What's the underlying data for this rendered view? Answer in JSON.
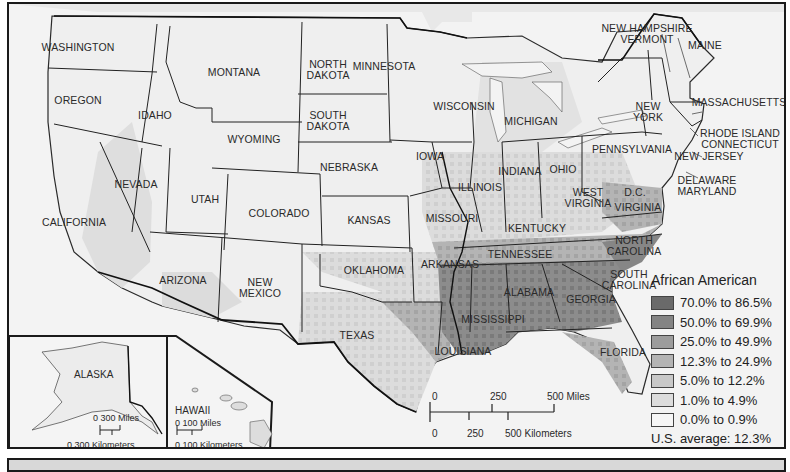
{
  "map": {
    "subject": "African American population by county",
    "legend": {
      "title": "African American",
      "classes": [
        {
          "label": "70.0% to 86.5%",
          "color": "#6a6a6a"
        },
        {
          "label": "50.0% to 69.9%",
          "color": "#848484"
        },
        {
          "label": "25.0% to 49.9%",
          "color": "#9c9c9c"
        },
        {
          "label": "12.3% to 24.9%",
          "color": "#b4b4b4"
        },
        {
          "label": "5.0% to 12.2%",
          "color": "#c8c8c8"
        },
        {
          "label": "1.0% to 4.9%",
          "color": "#dcdcdc"
        },
        {
          "label": "0.0% to 0.9%",
          "color": "#f6f6f6"
        }
      ],
      "us_average": "U.S. average:  12.3%"
    },
    "states": [
      {
        "name": "WASHINGTON",
        "x": 76,
        "y": 45
      },
      {
        "name": "OREGON",
        "x": 76,
        "y": 98
      },
      {
        "name": "IDAHO",
        "x": 153,
        "y": 113
      },
      {
        "name": "MONTANA",
        "x": 232,
        "y": 70
      },
      {
        "name": "WYOMING",
        "x": 252,
        "y": 137
      },
      {
        "name": "NORTH\nDAKOTA",
        "x": 326,
        "y": 62
      },
      {
        "name": "SOUTH\nDAKOTA",
        "x": 326,
        "y": 113
      },
      {
        "name": "MINNESOTA",
        "x": 382,
        "y": 64
      },
      {
        "name": "WISCONSIN",
        "x": 462,
        "y": 104
      },
      {
        "name": "MICHIGAN",
        "x": 529,
        "y": 119
      },
      {
        "name": "NEBRASKA",
        "x": 347,
        "y": 165
      },
      {
        "name": "IOWA",
        "x": 428,
        "y": 154
      },
      {
        "name": "ILLINOIS",
        "x": 478,
        "y": 185
      },
      {
        "name": "INDIANA",
        "x": 518,
        "y": 169
      },
      {
        "name": "OHIO",
        "x": 561,
        "y": 167
      },
      {
        "name": "NEVADA",
        "x": 134,
        "y": 182
      },
      {
        "name": "UTAH",
        "x": 203,
        "y": 197
      },
      {
        "name": "COLORADO",
        "x": 277,
        "y": 211
      },
      {
        "name": "KANSAS",
        "x": 367,
        "y": 218
      },
      {
        "name": "MISSOURI",
        "x": 450,
        "y": 216
      },
      {
        "name": "CALIFORNIA",
        "x": 72,
        "y": 220
      },
      {
        "name": "KENTUCKY",
        "x": 535,
        "y": 226
      },
      {
        "name": "WEST\nVIRGINIA",
        "x": 586,
        "y": 190
      },
      {
        "name": "VIRGINIA",
        "x": 636,
        "y": 205
      },
      {
        "name": "D.C.",
        "x": 633,
        "y": 190
      },
      {
        "name": "TENNESSEE",
        "x": 518,
        "y": 252
      },
      {
        "name": "NORTH\nCAROLINA",
        "x": 632,
        "y": 238
      },
      {
        "name": "ARIZONA",
        "x": 181,
        "y": 278
      },
      {
        "name": "NEW\nMEXICO",
        "x": 258,
        "y": 280
      },
      {
        "name": "OKLAHOMA",
        "x": 372,
        "y": 268
      },
      {
        "name": "ARKANSAS",
        "x": 448,
        "y": 262
      },
      {
        "name": "SOUTH\nCAROLINA",
        "x": 627,
        "y": 272
      },
      {
        "name": "ALABAMA",
        "x": 527,
        "y": 290
      },
      {
        "name": "GEORGIA",
        "x": 589,
        "y": 297
      },
      {
        "name": "MISSISSIPPI",
        "x": 491,
        "y": 317
      },
      {
        "name": "TEXAS",
        "x": 355,
        "y": 333
      },
      {
        "name": "LOUISIANA",
        "x": 461,
        "y": 349
      },
      {
        "name": "FLORIDA",
        "x": 621,
        "y": 350
      },
      {
        "name": "NEW YORK",
        "x": 646,
        "y": 104,
        "display": "NEW\nYORK"
      },
      {
        "name": "PENNSYLVANIA",
        "x": 630,
        "y": 147
      },
      {
        "name": "NEW JERSEY",
        "x": 707,
        "y": 154
      },
      {
        "name": "DELAWARE\nMARYLAND",
        "x": 705,
        "y": 178
      },
      {
        "name": "MASSACHUSETTS",
        "x": 737,
        "y": 100
      },
      {
        "name": "RHODE ISLAND\nCONNECTICUT",
        "x": 738,
        "y": 131
      },
      {
        "name": "NEW HAMPSHIRE\nVERMONT",
        "x": 645,
        "y": 26
      },
      {
        "name": "MAINE",
        "x": 703,
        "y": 43
      }
    ],
    "insets": {
      "alaska": {
        "label": "ALASKA",
        "scale_miles": "0    300 Miles",
        "scale_km": "0 300 Kilometers"
      },
      "hawaii": {
        "label": "HAWAII",
        "scale_miles": "0    100 Miles",
        "scale_km": "0  100 Kilometers"
      }
    },
    "scale_bar": {
      "miles_ticks": [
        "0",
        "250",
        "500 Miles"
      ],
      "km_ticks": [
        "0",
        "250",
        "500 Kilometers"
      ]
    }
  }
}
